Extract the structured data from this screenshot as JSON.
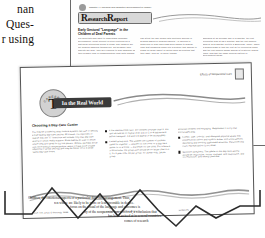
{
  "left_fragment": {
    "lines": [
      "nan",
      "Ques-",
      "r using"
    ]
  },
  "research_page": {
    "chapter_header": "Chapter 4 • Physical and Cognitive Development in Infancy",
    "banner_label": "Research Report",
    "banner_cap": "R",
    "banner_rest": "esearch",
    "banner_cap2": "R",
    "banner_rest2": "eport",
    "headline": "Early Gestural \"Language\" in the Children of Deaf Parents",
    "column1_text": "For scientists who want to understand language development, great interest is often centered on a particular interesting group to study. The children are not hearing impaired themselves, but because their parents are deaf, they are exposed to sign language as their primary form of communication from birth onward.",
    "column2_text": "can attest the age comes with gestures arriving in hearing babies of hearing parents. As obvious to observers of sign users had been shown to display from that unfamiliar signs into a gesture that appear to stand for some object or action such as pointing that they want, pick up, or move toward.",
    "column3_text": "appeared at an average age of 8 months, the first referential sign at 12.6 months, and the first spoken word at 13.2 months (Petitto & Bonvillian, 1991). When a hearing baby is that the first set of referential signs and the first spoken words appear at relatively similar times, and that the same general pattern of development holds."
  },
  "realworld_page": {
    "section_header": "Effects of Nonparental Care",
    "seal_text": "CAREERS",
    "seal_letter": "T",
    "banner_label": "In the Real World",
    "headline": "Choosing a Day-Care Center",
    "column1_text": "You may be wondering what criteria a parent can use to identify a high-quality day-care setting. Of course, it's important to realize that the \"it\" intentions will include only that day care setting to which really matters. Some babies do well in center where they are cared for by one person. Others, perhaps those with more difficult temperaments, seem to have more trouble adjusting to group settings and may be better off in a small family day-care home.",
    "bullets_middle": [
      "A low teacher/child ratio. For children younger than 2, the ratio should be no higher than 1:4 (or 1 to 4 babies and, before caregiver, 1:3 and 1:4 appear to be acceptable).",
      "A small group size. The smaller the number of children cared for together — whether in one room or a day-care center or in a home — the better for the child. For infants 6 to 12 months, the group size should be no larger than 6 to 8; for 2 year olds, 10 per group; for 3 year olds, 14 per group."
    ],
    "bullets_right": [
      "activities children find engaging. Supplement it a toy that encourages play.",
      "A clean, safe, colorful, well-designed physical space that includes both indoor and outdoor areas, with some specific identifying and working supervised activities. Personnel that count representation is not ideal.",
      "Sensitive caregivers. The adults in the day-care setting should be responsive, loving, involved, and responsive, and not restrictive, and merely custodial."
    ],
    "footnote_left": "note: Hill, Levin & Kennedy, 1999",
    "footnote_right": "the center must offer a variety of",
    "footnote_far": "guidelines"
  },
  "summary_block": {
    "lines": [
      "Children, the emotional aspects of a particular day-care arrangement. Thus,",
      "ren whose are likely to be more or less favorable in degree.",
      "focus on the visual of the language and outcomes is",
      "ity of the nonparental care received, a conclusion that",
      "has been arrived at in several countries.",
      "comes of research"
    ]
  },
  "colors": {
    "page_bg": "#ffffff",
    "canvas_bg": "#ffffff",
    "page_border": "#5f5f5f",
    "banner_dark": "#3b3b3b",
    "banner_light": "#d8d8d8",
    "seal_fill": "#d2d2d2",
    "text_ink": "#1a1714",
    "zigzag": "#2b2b2b"
  }
}
